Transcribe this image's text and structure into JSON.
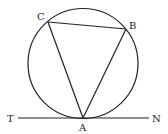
{
  "diagram": {
    "type": "geometry",
    "stroke_color": "#222222",
    "circle": {
      "cx": 83,
      "cy": 63.5,
      "r": 55
    },
    "points": {
      "A": {
        "label": "A",
        "x": 83,
        "y": 118
      },
      "B": {
        "label": "B",
        "x": 126,
        "y": 29
      },
      "C": {
        "label": "C",
        "x": 48,
        "y": 22
      },
      "T": {
        "label": "T",
        "x": 18,
        "y": 118
      },
      "N": {
        "label": "N",
        "x": 149,
        "y": 118
      }
    },
    "segments": [
      "AB",
      "BC",
      "CA",
      "TN"
    ]
  }
}
